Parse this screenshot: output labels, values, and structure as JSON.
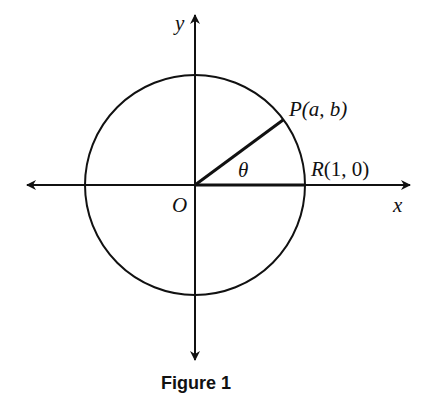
{
  "diagram": {
    "type": "unit-circle",
    "caption": "Figure 1",
    "labels": {
      "y_axis": "y",
      "x_axis": "x",
      "origin": "O",
      "angle": "θ",
      "point_p_letter": "P",
      "point_p_coords": "(a, b)",
      "point_r_letter": "R",
      "point_r_coords": "(1, 0)"
    },
    "colors": {
      "stroke": "#111111",
      "background": "#ffffff"
    }
  }
}
